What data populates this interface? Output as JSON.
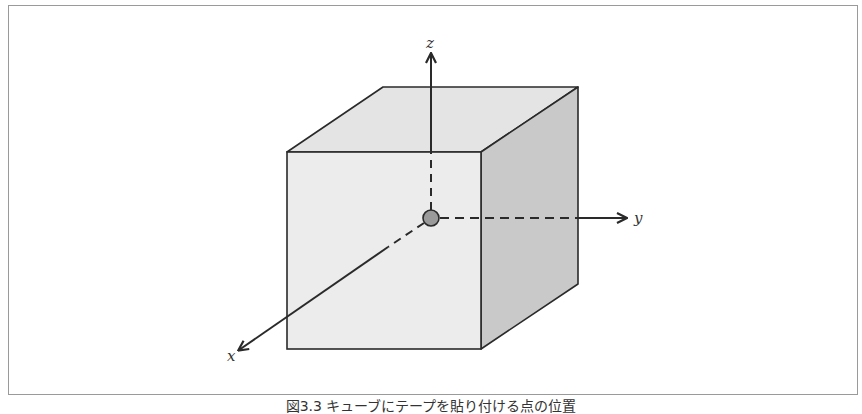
{
  "figure": {
    "caption": "図3.3 キューブにテープを貼り付ける点の位置",
    "axes": {
      "x": {
        "label": "x"
      },
      "y": {
        "label": "y"
      },
      "z": {
        "label": "z"
      }
    },
    "colors": {
      "front_face": "#ececec",
      "top_face": "#e4e4e4",
      "right_face": "#c9c9c9",
      "edge": "#2a2a2a",
      "origin_point": "#9a9a9a",
      "frame_border": "#9a9a9a"
    },
    "elements": {
      "cube": "cube",
      "origin": "origin-point"
    }
  }
}
